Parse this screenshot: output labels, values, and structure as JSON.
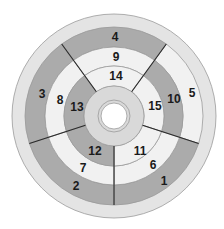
{
  "diagram": {
    "type": "bullseye",
    "center": [
      114,
      116
    ],
    "colors": {
      "dark": "#ababab",
      "light": "#f1f1f1",
      "rim": "#e4e4e4",
      "core": "#d9d9d9",
      "stroke": "#9a9a9a",
      "divider": "#2a2a2a",
      "hole": "#ffffff"
    },
    "radii": {
      "outer": 102,
      "rim_inner": 89,
      "basal_inner": 69,
      "mid_inner": 50,
      "apical_inner": 30,
      "core_line": 16,
      "hole": 13
    },
    "divider_angles_deg": [
      -54,
      18,
      90,
      162,
      234
    ],
    "rings": [
      {
        "name": "basal",
        "segments": [
          {
            "label": "5",
            "shade": "light",
            "from": -54,
            "to": 18
          },
          {
            "label": "1",
            "shade": "dark",
            "from": 18,
            "to": 90
          },
          {
            "label": "2",
            "shade": "dark",
            "from": 90,
            "to": 162
          },
          {
            "label": "3",
            "shade": "dark",
            "from": 162,
            "to": 234
          },
          {
            "label": "4",
            "shade": "dark",
            "from": 234,
            "to": 306
          }
        ]
      },
      {
        "name": "mid",
        "segments": [
          {
            "label": "10",
            "shade": "dark",
            "from": -54,
            "to": 18
          },
          {
            "label": "6",
            "shade": "light",
            "from": 18,
            "to": 90
          },
          {
            "label": "7",
            "shade": "light",
            "from": 90,
            "to": 162
          },
          {
            "label": "8",
            "shade": "light",
            "from": 162,
            "to": 234
          },
          {
            "label": "9",
            "shade": "light",
            "from": 234,
            "to": 306
          }
        ]
      },
      {
        "name": "apical",
        "segments": [
          {
            "label": "15",
            "shade": "light",
            "from": -54,
            "to": 18
          },
          {
            "label": "11",
            "shade": "light",
            "from": 18,
            "to": 90
          },
          {
            "label": "12",
            "shade": "dark",
            "from": 90,
            "to": 162
          },
          {
            "label": "13",
            "shade": "dark",
            "from": 162,
            "to": 234
          },
          {
            "label": "14",
            "shade": "light",
            "from": 234,
            "to": 306
          }
        ]
      }
    ],
    "labels": [
      {
        "text": "4",
        "x": 115,
        "y": 37
      },
      {
        "text": "9",
        "x": 116,
        "y": 57
      },
      {
        "text": "14",
        "x": 116,
        "y": 76
      },
      {
        "text": "3",
        "x": 42,
        "y": 94
      },
      {
        "text": "8",
        "x": 60,
        "y": 100
      },
      {
        "text": "13",
        "x": 77,
        "y": 107
      },
      {
        "text": "15",
        "x": 155,
        "y": 106
      },
      {
        "text": "10",
        "x": 174,
        "y": 99
      },
      {
        "text": "5",
        "x": 192,
        "y": 93
      },
      {
        "text": "12",
        "x": 95,
        "y": 151
      },
      {
        "text": "11",
        "x": 140,
        "y": 151
      },
      {
        "text": "7",
        "x": 83,
        "y": 168
      },
      {
        "text": "6",
        "x": 153,
        "y": 165
      },
      {
        "text": "2",
        "x": 76,
        "y": 186
      },
      {
        "text": "1",
        "x": 164,
        "y": 181
      }
    ]
  }
}
